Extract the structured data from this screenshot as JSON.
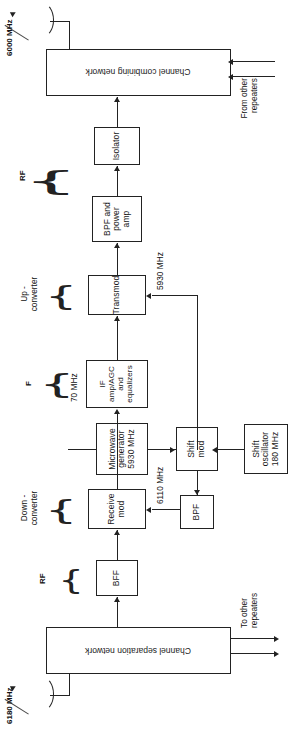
{
  "diagram": {
    "antennas": {
      "receive": {
        "label": "6180 MHz",
        "icon": "antenna-icon",
        "direction": "incoming"
      },
      "transmit": {
        "label": "6000 MHz",
        "icon": "antenna-icon",
        "direction": "outgoing"
      }
    },
    "bars": {
      "separation": "Channel separation network",
      "combining": "Channel combining network"
    },
    "blocks": {
      "bff": "BFF",
      "receive_mod": "Receive mod",
      "if_amp": "IF amp/AGC\nand\nequalizers",
      "if_amp_line1": "IF amp/AGC",
      "if_amp_line2": "and",
      "if_amp_line3": "equalizers",
      "transmod": "Transmod",
      "bpf_power_amp_line1": "BPF and",
      "bpf_power_amp_line2": "power",
      "bpf_power_amp_line3": "amp",
      "isolator": "Isolator",
      "bpf": "BPF",
      "shift_mod_line1": "Shift",
      "shift_mod_line2": "mod",
      "shift_osc_line1": "Shift",
      "shift_osc_line2": "oscillator",
      "shift_osc_line3": "180 MHz",
      "microwave_gen_line1": "Microwave",
      "microwave_gen_line2": "generator",
      "microwave_gen_line3": "5930 MHz"
    },
    "signal_labels": {
      "rf_receive": "RF",
      "rf_transmit": "RF",
      "if_group": "F",
      "down_converter_line1": "Down -",
      "down_converter_line2": "converter",
      "up_converter_line1": "Up -",
      "up_converter_line2": "converter",
      "freq_6110": "6110 MHz",
      "freq_70": "70 MHz",
      "freq_5930": "5930 MHz"
    },
    "ports": {
      "to_other_line1": "To other",
      "to_other_line2": "repeaters",
      "from_other_line1": "From other",
      "from_other_line2": "repeaters"
    },
    "colors": {
      "ink": "#222222",
      "paper": "#ffffff"
    }
  }
}
